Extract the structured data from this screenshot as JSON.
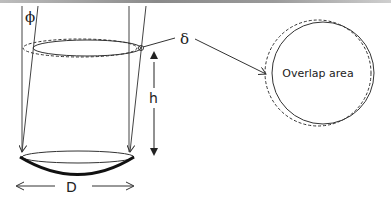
{
  "diagram": {
    "labels": {
      "phi": "ϕ",
      "delta": "δ",
      "height": "h",
      "diameter": "D",
      "overlap": "Overlap area"
    },
    "colors": {
      "stroke": "#333333",
      "thick_stroke": "#111111",
      "background": "#ffffff"
    }
  }
}
